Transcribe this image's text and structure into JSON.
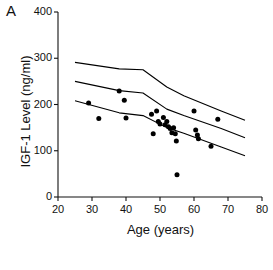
{
  "panel": {
    "label": "A"
  },
  "chart_data": {
    "type": "scatter",
    "title": "",
    "xlabel": "Age (years)",
    "ylabel": "IGF-1 Level (ng/ml)",
    "xlim": [
      20,
      80
    ],
    "ylim": [
      0,
      400
    ],
    "xticks": [
      20,
      30,
      40,
      50,
      60,
      70,
      80
    ],
    "yticks": [
      0,
      100,
      200,
      300,
      400
    ],
    "grid": false,
    "legend": "none",
    "marker": "filled-circle",
    "marker_color": "#000000",
    "line_color": "#000000",
    "points": [
      {
        "x": 29,
        "y": 203
      },
      {
        "x": 32,
        "y": 170
      },
      {
        "x": 38,
        "y": 229
      },
      {
        "x": 39.5,
        "y": 209
      },
      {
        "x": 40,
        "y": 171
      },
      {
        "x": 47.5,
        "y": 179
      },
      {
        "x": 48,
        "y": 137
      },
      {
        "x": 49,
        "y": 186
      },
      {
        "x": 49.5,
        "y": 163
      },
      {
        "x": 50,
        "y": 158
      },
      {
        "x": 51,
        "y": 172
      },
      {
        "x": 51.5,
        "y": 156
      },
      {
        "x": 52,
        "y": 163
      },
      {
        "x": 52.5,
        "y": 152
      },
      {
        "x": 53,
        "y": 148
      },
      {
        "x": 53.5,
        "y": 139
      },
      {
        "x": 54,
        "y": 150
      },
      {
        "x": 54.5,
        "y": 137
      },
      {
        "x": 54.8,
        "y": 121
      },
      {
        "x": 55,
        "y": 48
      },
      {
        "x": 60,
        "y": 186
      },
      {
        "x": 60.5,
        "y": 145
      },
      {
        "x": 61,
        "y": 134
      },
      {
        "x": 61.3,
        "y": 126
      },
      {
        "x": 65,
        "y": 110
      },
      {
        "x": 67,
        "y": 168
      }
    ],
    "reference_curves": [
      {
        "name": "upper-reference-curve",
        "points": [
          {
            "x": 25,
            "y": 291
          },
          {
            "x": 38,
            "y": 277
          },
          {
            "x": 45,
            "y": 275
          },
          {
            "x": 52,
            "y": 238
          },
          {
            "x": 57,
            "y": 219
          },
          {
            "x": 68,
            "y": 186
          },
          {
            "x": 75,
            "y": 166
          }
        ]
      },
      {
        "name": "middle-reference-curve",
        "points": [
          {
            "x": 25,
            "y": 250
          },
          {
            "x": 38,
            "y": 230
          },
          {
            "x": 45,
            "y": 225
          },
          {
            "x": 52,
            "y": 190
          },
          {
            "x": 57,
            "y": 176
          },
          {
            "x": 68,
            "y": 148
          },
          {
            "x": 75,
            "y": 128
          }
        ]
      },
      {
        "name": "lower-reference-curve",
        "points": [
          {
            "x": 25,
            "y": 208
          },
          {
            "x": 38,
            "y": 182
          },
          {
            "x": 45,
            "y": 176
          },
          {
            "x": 52,
            "y": 150
          },
          {
            "x": 57,
            "y": 138
          },
          {
            "x": 68,
            "y": 108
          },
          {
            "x": 75,
            "y": 89
          }
        ]
      }
    ]
  }
}
